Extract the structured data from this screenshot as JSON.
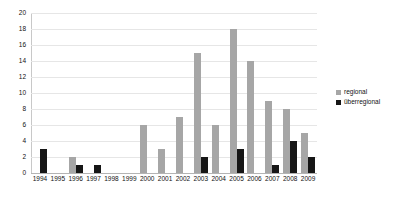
{
  "chart_data": {
    "type": "bar",
    "title": "",
    "subtitle": "",
    "xlabel": "",
    "ylabel": "",
    "ylim": [
      0,
      20
    ],
    "ytick_step": 2,
    "yticks": [
      0,
      2,
      4,
      6,
      8,
      10,
      12,
      14,
      16,
      18,
      20
    ],
    "grid": true,
    "legend_position": "right",
    "categories": [
      "1994",
      "1995",
      "1996",
      "1997",
      "1998",
      "1999",
      "2000",
      "2001",
      "2002",
      "2003",
      "2004",
      "2005",
      "2006",
      "2007",
      "2008",
      "2009"
    ],
    "series": [
      {
        "name": "regional",
        "color": "#a6a6a6",
        "values": [
          0,
          0,
          2,
          0,
          0,
          0,
          6,
          3,
          7,
          15,
          6,
          18,
          14,
          9,
          8,
          5
        ]
      },
      {
        "name": "überregional",
        "color": "#161616",
        "values": [
          3,
          0,
          1,
          1,
          0,
          0,
          0,
          0,
          0,
          2,
          0,
          3,
          0,
          1,
          4,
          2
        ]
      }
    ]
  },
  "legend": {
    "items": [
      {
        "label": "regional",
        "color": "#a6a6a6"
      },
      {
        "label": "überregional",
        "color": "#161616"
      }
    ]
  },
  "axes": {
    "y": {
      "ticks": [
        "0",
        "2",
        "4",
        "6",
        "8",
        "10",
        "12",
        "14",
        "16",
        "18",
        "20"
      ]
    },
    "x": {
      "ticks": [
        "1994",
        "1995",
        "1996",
        "1997",
        "1998",
        "1999",
        "2000",
        "2001",
        "2002",
        "2003",
        "2004",
        "2005",
        "2006",
        "2007",
        "2008",
        "2009"
      ]
    }
  }
}
